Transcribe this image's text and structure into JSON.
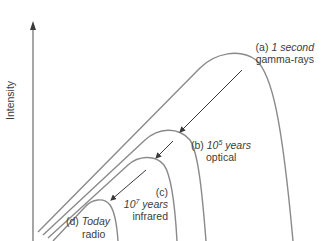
{
  "diagram": {
    "y_axis_label": "Intensity",
    "line_color": "#8a8a8a",
    "arrow_color": "#3a3a3a",
    "curves": [
      {
        "id": "a",
        "tag": "(a)",
        "time": "1 second",
        "band": "gamma-rays"
      },
      {
        "id": "b",
        "tag": "(b)",
        "time_base": "10",
        "time_exp": "5",
        "time_unit": "years",
        "band": "optical"
      },
      {
        "id": "c",
        "tag": "(c)",
        "time_base": "10",
        "time_exp": "7",
        "time_unit": "years",
        "band": "infrared"
      },
      {
        "id": "d",
        "tag": "(d)",
        "time": "Today",
        "band": "radio"
      }
    ]
  }
}
